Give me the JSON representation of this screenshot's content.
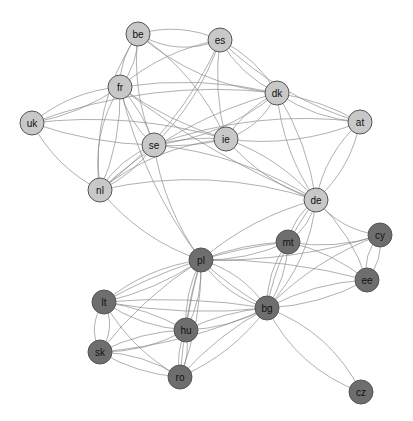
{
  "diagram": {
    "type": "network",
    "colors": {
      "group_light": "#c8c8c8",
      "group_dark": "#6e6e6e",
      "edge": "#8a8a8a"
    },
    "node_radius": 12,
    "nodes": [
      {
        "id": "be",
        "label": "be",
        "x": 138,
        "y": 34,
        "group": "light"
      },
      {
        "id": "es",
        "label": "es",
        "x": 220,
        "y": 40,
        "group": "light"
      },
      {
        "id": "fr",
        "label": "fr",
        "x": 120,
        "y": 87,
        "group": "light"
      },
      {
        "id": "uk",
        "label": "uk",
        "x": 32,
        "y": 123,
        "group": "light"
      },
      {
        "id": "se",
        "label": "se",
        "x": 154,
        "y": 145,
        "group": "light"
      },
      {
        "id": "ie",
        "label": "ie",
        "x": 226,
        "y": 139,
        "group": "light"
      },
      {
        "id": "dk",
        "label": "dk",
        "x": 277,
        "y": 93,
        "group": "light"
      },
      {
        "id": "at",
        "label": "at",
        "x": 360,
        "y": 122,
        "group": "light"
      },
      {
        "id": "nl",
        "label": "nl",
        "x": 100,
        "y": 190,
        "group": "light"
      },
      {
        "id": "de",
        "label": "de",
        "x": 316,
        "y": 200,
        "group": "light"
      },
      {
        "id": "pl",
        "label": "pl",
        "x": 201,
        "y": 260,
        "group": "dark"
      },
      {
        "id": "mt",
        "label": "mt",
        "x": 288,
        "y": 242,
        "group": "dark"
      },
      {
        "id": "cy",
        "label": "cy",
        "x": 380,
        "y": 235,
        "group": "dark"
      },
      {
        "id": "ee",
        "label": "ee",
        "x": 367,
        "y": 280,
        "group": "dark"
      },
      {
        "id": "lt",
        "label": "lt",
        "x": 104,
        "y": 302,
        "group": "dark"
      },
      {
        "id": "hu",
        "label": "hu",
        "x": 186,
        "y": 330,
        "group": "dark"
      },
      {
        "id": "bg",
        "label": "bg",
        "x": 267,
        "y": 308,
        "group": "dark"
      },
      {
        "id": "sk",
        "label": "sk",
        "x": 100,
        "y": 352,
        "group": "dark"
      },
      {
        "id": "ro",
        "label": "ro",
        "x": 180,
        "y": 377,
        "group": "dark"
      },
      {
        "id": "cz",
        "label": "cz",
        "x": 361,
        "y": 392,
        "group": "dark"
      }
    ],
    "edges": [
      [
        "be",
        "es",
        20
      ],
      [
        "be",
        "es",
        -15
      ],
      [
        "be",
        "fr",
        10
      ],
      [
        "be",
        "fr",
        -10
      ],
      [
        "be",
        "se",
        15
      ],
      [
        "be",
        "dk",
        25
      ],
      [
        "be",
        "ie",
        -20
      ],
      [
        "be",
        "nl",
        30
      ],
      [
        "es",
        "fr",
        15
      ],
      [
        "es",
        "dk",
        -12
      ],
      [
        "es",
        "dk",
        12
      ],
      [
        "es",
        "se",
        -15
      ],
      [
        "es",
        "ie",
        10
      ],
      [
        "es",
        "nl",
        -25
      ],
      [
        "es",
        "at",
        20
      ],
      [
        "fr",
        "uk",
        15
      ],
      [
        "fr",
        "uk",
        -10
      ],
      [
        "fr",
        "se",
        12
      ],
      [
        "fr",
        "se",
        -8
      ],
      [
        "fr",
        "ie",
        10
      ],
      [
        "fr",
        "dk",
        -15
      ],
      [
        "fr",
        "nl",
        20
      ],
      [
        "fr",
        "nl",
        -12
      ],
      [
        "fr",
        "de",
        15
      ],
      [
        "fr",
        "pl",
        20
      ],
      [
        "uk",
        "se",
        10
      ],
      [
        "uk",
        "nl",
        15
      ],
      [
        "uk",
        "ie",
        -20
      ],
      [
        "uk",
        "dk",
        -30
      ],
      [
        "se",
        "ie",
        6
      ],
      [
        "se",
        "ie",
        -6
      ],
      [
        "se",
        "dk",
        20
      ],
      [
        "se",
        "nl",
        12
      ],
      [
        "se",
        "nl",
        -10
      ],
      [
        "se",
        "pl",
        15
      ],
      [
        "se",
        "de",
        -20
      ],
      [
        "se",
        "at",
        -25
      ],
      [
        "ie",
        "dk",
        15
      ],
      [
        "ie",
        "dk",
        -10
      ],
      [
        "ie",
        "at",
        18
      ],
      [
        "ie",
        "de",
        -15
      ],
      [
        "ie",
        "nl",
        20
      ],
      [
        "ie",
        "de",
        15
      ],
      [
        "dk",
        "at",
        12
      ],
      [
        "dk",
        "at",
        -8
      ],
      [
        "dk",
        "de",
        15
      ],
      [
        "dk",
        "de",
        -12
      ],
      [
        "dk",
        "nl",
        25
      ],
      [
        "at",
        "de",
        15
      ],
      [
        "at",
        "de",
        -15
      ],
      [
        "nl",
        "pl",
        18
      ],
      [
        "nl",
        "de",
        -30
      ],
      [
        "de",
        "pl",
        15
      ],
      [
        "de",
        "mt",
        10
      ],
      [
        "de",
        "mt",
        -10
      ],
      [
        "de",
        "cy",
        15
      ],
      [
        "de",
        "ee",
        -12
      ],
      [
        "de",
        "bg",
        15
      ],
      [
        "de",
        "bg",
        -20
      ],
      [
        "pl",
        "mt",
        10
      ],
      [
        "pl",
        "mt",
        -8
      ],
      [
        "pl",
        "cy",
        15
      ],
      [
        "pl",
        "ee",
        -12
      ],
      [
        "pl",
        "lt",
        15
      ],
      [
        "pl",
        "lt",
        -10
      ],
      [
        "pl",
        "hu",
        10
      ],
      [
        "pl",
        "hu",
        -10
      ],
      [
        "pl",
        "hu",
        4
      ],
      [
        "pl",
        "bg",
        15
      ],
      [
        "pl",
        "bg",
        -15
      ],
      [
        "pl",
        "bg",
        5
      ],
      [
        "pl",
        "sk",
        12
      ],
      [
        "pl",
        "ro",
        -12
      ],
      [
        "pl",
        "ro",
        6
      ],
      [
        "mt",
        "cy",
        12
      ],
      [
        "mt",
        "ee",
        -10
      ],
      [
        "mt",
        "bg",
        12
      ],
      [
        "mt",
        "bg",
        -10
      ],
      [
        "mt",
        "lt",
        20
      ],
      [
        "cy",
        "ee",
        12
      ],
      [
        "cy",
        "ee",
        -10
      ],
      [
        "cy",
        "bg",
        15
      ],
      [
        "ee",
        "bg",
        12
      ],
      [
        "ee",
        "bg",
        -12
      ],
      [
        "lt",
        "sk",
        15
      ],
      [
        "lt",
        "sk",
        -15
      ],
      [
        "lt",
        "hu",
        12
      ],
      [
        "lt",
        "hu",
        -8
      ],
      [
        "lt",
        "ro",
        15
      ],
      [
        "lt",
        "bg",
        -10
      ],
      [
        "lt",
        "bg",
        12
      ],
      [
        "hu",
        "sk",
        10
      ],
      [
        "hu",
        "sk",
        -12
      ],
      [
        "hu",
        "ro",
        8
      ],
      [
        "hu",
        "ro",
        -8
      ],
      [
        "hu",
        "bg",
        10
      ],
      [
        "hu",
        "bg",
        -8
      ],
      [
        "sk",
        "ro",
        10
      ],
      [
        "sk",
        "ro",
        -12
      ],
      [
        "sk",
        "bg",
        15
      ],
      [
        "ro",
        "bg",
        15
      ],
      [
        "ro",
        "bg",
        -10
      ],
      [
        "bg",
        "cz",
        25
      ],
      [
        "bg",
        "cz",
        -25
      ]
    ]
  }
}
